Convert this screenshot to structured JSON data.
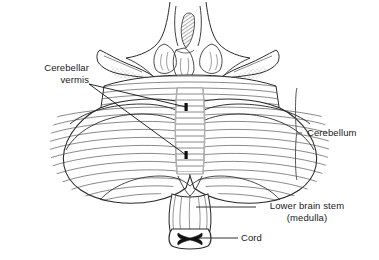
{
  "figure": {
    "background_color": "#ffffff",
    "ink_color": "#1a1a1a",
    "shading_color": "#8a8a8a"
  },
  "labels": {
    "cerebellar_vermis": {
      "line1": "Cerebellar",
      "line2": "vermis"
    },
    "cerebellum": "Cerebellum",
    "lower_brain_stem": {
      "line1": "Lower brain stem",
      "line2": "(medulla)"
    },
    "cord": "Cord"
  },
  "anatomy": {
    "structures": [
      "midbrain",
      "pineal-region",
      "superior-cerebellar-peduncle-left",
      "superior-cerebellar-peduncle-right",
      "cerebellar-hemisphere-left",
      "cerebellar-hemisphere-right",
      "cerebellar-vermis",
      "medulla",
      "spinal-cord-cross-section"
    ]
  }
}
